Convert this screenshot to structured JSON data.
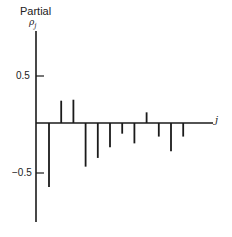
{
  "chart_data": {
    "type": "bar",
    "subtype": "stem (partial autocorrelation function)",
    "title": "Partial",
    "ylabel": "ρj",
    "xlabel": "j",
    "yticks": [
      0.5,
      -0.5
    ],
    "ytick_labels": [
      "0.5",
      "−0.5"
    ],
    "ylim": [
      -1.0,
      0.9
    ],
    "grid": false,
    "legend": null,
    "categories": [
      1,
      2,
      3,
      4,
      5,
      6,
      7,
      8,
      9,
      10,
      11,
      12
    ],
    "values": [
      -0.66,
      0.23,
      0.24,
      -0.45,
      -0.36,
      -0.25,
      -0.11,
      -0.21,
      0.11,
      -0.14,
      -0.29,
      -0.14
    ]
  },
  "labels": {
    "title": "Partial",
    "ylabel": "ρ",
    "ylabel_sub": "j",
    "xlabel": "j",
    "tick_pos": "0.5",
    "tick_neg": "−0.5"
  }
}
